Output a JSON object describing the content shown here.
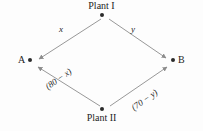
{
  "figure": {
    "type": "transportation-network-diagram",
    "background_color": "#fdfdfd",
    "line_color": "#8c8c8c",
    "node_color": "#2b2b2b",
    "nodes": [
      {
        "id": "plant-1",
        "label": "Plant I",
        "label_position": "above",
        "x": 105,
        "y": 15
      },
      {
        "id": "plant-2",
        "label": "Plant II",
        "label_position": "below",
        "x": 105,
        "y": 110
      },
      {
        "id": "a",
        "label": "A",
        "label_position": "left",
        "x": 31,
        "y": 62
      },
      {
        "id": "b",
        "label": "B",
        "label_position": "right",
        "x": 173,
        "y": 62
      }
    ],
    "edges": [
      {
        "from": "plant-1",
        "to": "a",
        "label": "x",
        "arrow": "to"
      },
      {
        "from": "plant-1",
        "to": "b",
        "label": "y",
        "arrow": "to"
      },
      {
        "from": "plant-2",
        "to": "a",
        "label": "(80 − x)",
        "arrow": "to"
      },
      {
        "from": "plant-2",
        "to": "b",
        "label": "(70 − y)",
        "arrow": "to"
      }
    ]
  }
}
